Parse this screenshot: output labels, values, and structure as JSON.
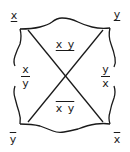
{
  "diagram": {
    "corners": {
      "top_left": "x",
      "top_right": "y",
      "bottom_left": "y",
      "bottom_right": "x"
    },
    "corner_marks": {
      "top_left": "underline",
      "top_right": "underline",
      "bottom_left": "overline",
      "bottom_right": "overline"
    },
    "sides": {
      "left": {
        "numerator": "x",
        "denominator": "y"
      },
      "right": {
        "numerator": "y",
        "denominator": "x"
      }
    },
    "center": {
      "top": "x y",
      "top_mark": "underline",
      "bottom": "x y",
      "bottom_mark": "overline"
    },
    "stroke_color": "#1a1a1a",
    "background": "#ffffff"
  }
}
